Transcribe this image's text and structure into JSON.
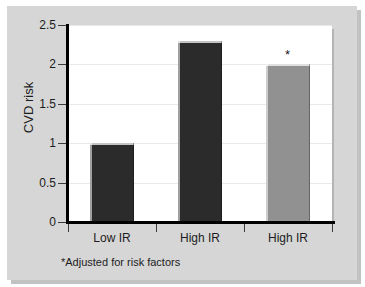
{
  "chart_data": {
    "type": "bar",
    "title": "",
    "subtitle": "",
    "xlabel": "",
    "ylabel": "CVD risk",
    "categories": [
      "Low IR",
      "High IR",
      "High IR"
    ],
    "values": [
      1.0,
      2.3,
      2.0
    ],
    "bar_colors": [
      "#2b2b2b",
      "#2b2b2b",
      "#919191"
    ],
    "point_annotations": [
      "",
      "",
      "*"
    ],
    "ylim": [
      0,
      2.5
    ],
    "y_ticks": [
      0,
      0.5,
      1,
      1.5,
      2,
      2.5
    ],
    "y_tick_labels": [
      "0",
      "0.5",
      "1",
      "1.5",
      "2",
      "2.5"
    ],
    "grid": true,
    "grid_axis": "y",
    "legend": false,
    "legend_position": "none",
    "annotations": [
      {
        "name": "footnote",
        "text": "*Adjusted for risk factors"
      }
    ],
    "colors": {
      "figure_background": "#d6d6d6",
      "plot_background": "#ffffff",
      "axis": "#000000",
      "gridline": "#e9e9e9",
      "text": "#1c1c1c",
      "bar_dark": "#2b2b2b",
      "bar_gray": "#919191"
    }
  },
  "axis": {
    "y_label": "CVD risk"
  },
  "footnote": {
    "text": "*Adjusted for risk factors"
  }
}
